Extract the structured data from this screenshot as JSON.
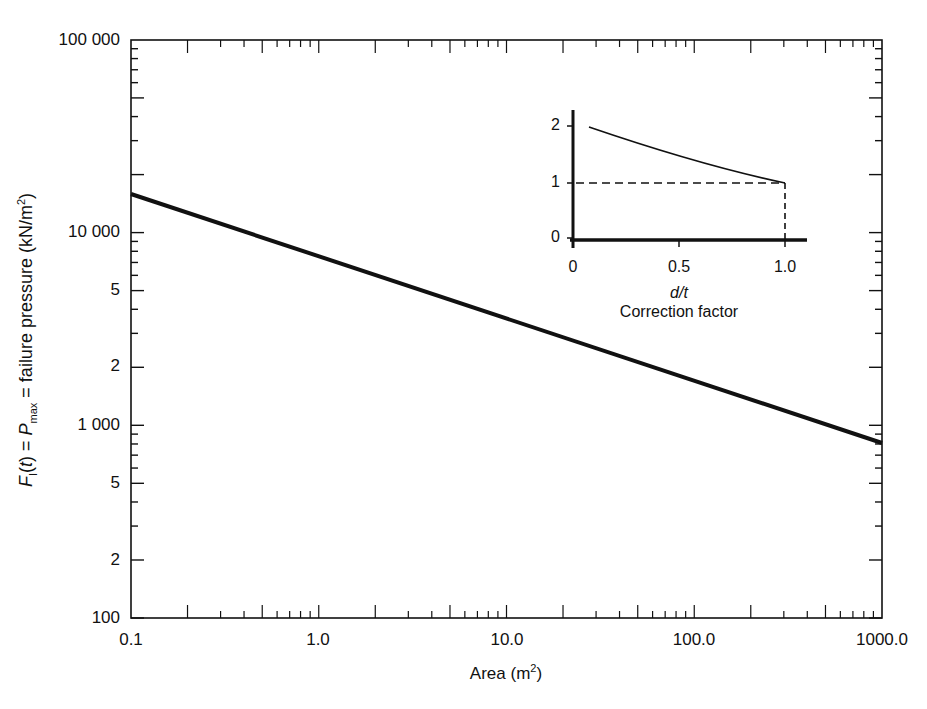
{
  "chart_data": [
    {
      "type": "line",
      "title": "",
      "xlabel": "Area (m²)",
      "ylabel": "F_I(t) = P_max = failure pressure (kN/m²)",
      "xscale": "log",
      "yscale": "log",
      "xlim": [
        0.1,
        1000.0
      ],
      "ylim": [
        100,
        100000
      ],
      "x_ticks": [
        "0.1",
        "1.0",
        "10.0",
        "100.0",
        "1000.0"
      ],
      "y_ticks": [
        "100",
        "2",
        "5",
        "1 000",
        "2",
        "5",
        "10 000",
        "100 000"
      ],
      "grid": false,
      "series": [
        {
          "name": "Failure pressure",
          "x": [
            0.1,
            1.0,
            10.0,
            100.0,
            1000.0
          ],
          "y": [
            15900,
            7400,
            3500,
            1650,
            800
          ]
        }
      ]
    },
    {
      "type": "line",
      "title": "Correction factor",
      "xlabel": "d/t",
      "ylabel": "",
      "xlim": [
        0,
        1.1
      ],
      "ylim": [
        0,
        2.2
      ],
      "x_ticks": [
        "0",
        "0.5",
        "1.0"
      ],
      "y_ticks": [
        "0",
        "1",
        "2"
      ],
      "series": [
        {
          "name": "Correction factor curve",
          "x": [
            0.08,
            0.2,
            0.4,
            0.6,
            0.8,
            1.0
          ],
          "y": [
            2.0,
            1.75,
            1.4,
            1.15,
            1.02,
            1.0
          ]
        },
        {
          "name": "Reference level (dashed)",
          "x": [
            0,
            1.0,
            1.0
          ],
          "y": [
            1,
            1,
            0
          ],
          "style": "dashed"
        }
      ]
    }
  ],
  "main": {
    "y_tick_labels": [
      {
        "label": "100 000",
        "y": 40
      },
      {
        "label": "10 000",
        "y": 232
      },
      {
        "label": "5",
        "y": 290
      },
      {
        "label": "2",
        "y": 366
      },
      {
        "label": "1 000",
        "y": 425
      },
      {
        "label": "5",
        "y": 483
      },
      {
        "label": "2",
        "y": 560
      },
      {
        "label": "100",
        "y": 618
      }
    ],
    "x_tick_labels": [
      {
        "label": "0.1",
        "x": 131
      },
      {
        "label": "1.0",
        "x": 318
      },
      {
        "label": "10.0",
        "x": 507
      },
      {
        "label": "100.0",
        "x": 694
      },
      {
        "label": "1000.0",
        "x": 882
      }
    ],
    "ylabel_prefix": "F",
    "ylabel_sub1": "I",
    "ylabel_mid": "(t) = ",
    "ylabel_p": "P",
    "ylabel_sub2": "max",
    "ylabel_rest": " = failure pressure (kN/m",
    "ylabel_sup": "2",
    "ylabel_close": ")",
    "xlabel_text": "Area (m",
    "xlabel_sup": "2",
    "xlabel_close": ")"
  },
  "inset": {
    "y_ticks": [
      {
        "label": "2",
        "y": 126
      },
      {
        "label": "1",
        "y": 183
      },
      {
        "label": "0",
        "y": 238
      }
    ],
    "x_ticks": [
      {
        "label": "0",
        "x": 573
      },
      {
        "label": "0.5",
        "x": 679
      },
      {
        "label": "1.0",
        "x": 785
      }
    ],
    "xlabel": "d/t",
    "title": "Correction factor"
  }
}
